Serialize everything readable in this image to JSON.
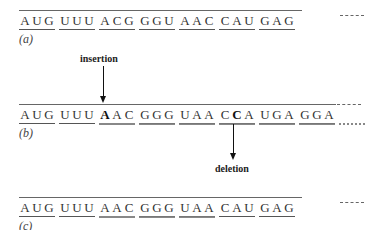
{
  "diagram": {
    "title": "",
    "rows": [
      {
        "id": "a",
        "label": "(a)",
        "nucleotides": [
          "A",
          "U",
          "G",
          "U",
          "U",
          "U",
          "A",
          "C",
          "G",
          "G",
          "G",
          "U",
          "A",
          "A",
          "C",
          "C",
          "A",
          "U",
          "G",
          "A",
          "G",
          "G",
          "A",
          "G"
        ],
        "bold_positions": [],
        "codons": [
          "AUG",
          "UUU",
          "ACG",
          "GGU",
          "AAC",
          "CAU",
          "GAG",
          "GAG"
        ],
        "continuation": "-------"
      },
      {
        "id": "b",
        "label": "(b)",
        "nucleotides": [
          "A",
          "U",
          "G",
          "U",
          "U",
          "U",
          "A",
          "A",
          "C",
          "G",
          "G",
          "G",
          "U",
          "A",
          "A",
          "C",
          "C",
          "A",
          "U",
          "G",
          "A",
          "G",
          "G",
          "A",
          "G"
        ],
        "bold_positions": [
          6,
          16
        ],
        "codons": [
          "AUG",
          "UUU",
          "AAC",
          "GGG",
          "UAA",
          "CCA",
          "UGA",
          "GGA",
          "G"
        ],
        "continuation": "-------"
      },
      {
        "id": "c",
        "label": "(c)",
        "nucleotides": [
          "A",
          "U",
          "G",
          "U",
          "U",
          "U",
          "A",
          "A",
          "C",
          "G",
          "G",
          "G",
          "U",
          "A",
          "A",
          "C",
          "A",
          "U",
          "G",
          "A",
          "G",
          "G",
          "A",
          "G"
        ],
        "bold_positions": [],
        "codons": [
          "AUG",
          "UUU",
          "AAC",
          "GGG",
          "UAA",
          "CAU",
          "GAG",
          "GAG"
        ],
        "continuation": "-------"
      }
    ],
    "annotations": {
      "insertion": {
        "label": "insertion",
        "target_row": "b",
        "target_index": 6,
        "direction": "down"
      },
      "deletion": {
        "label": "deletion",
        "target_row": "b",
        "target_index": 16,
        "direction": "down-from-row"
      }
    }
  }
}
